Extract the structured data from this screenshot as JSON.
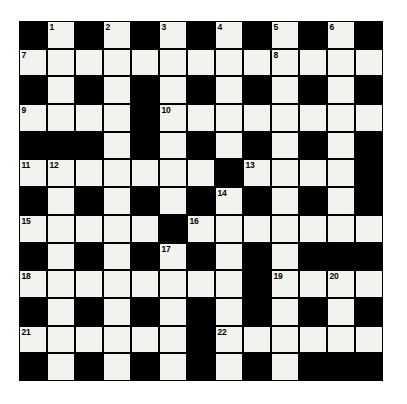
{
  "puzzle": {
    "type": "crossword-grid",
    "title": "Crossword Puzzle Grid",
    "rows": 13,
    "columns": 13,
    "colors": {
      "block": "#000000",
      "cell": "#f2f2ee",
      "border": "#000000",
      "page_background": "#ffffff",
      "number_text": "#000000"
    },
    "legend": {
      "block_symbol": "#",
      "open_symbol": "."
    },
    "grid": [
      "#.#.#.#.#.#.#",
      ".............",
      "#.#.#.#.#.#.#",
      "....#........",
      "###.#.#.#.#.#",
      ".......#....#",
      "#.#.#.#.#.#.#",
      ".....#.......",
      "#.#.#.#.#.###",
      "........#....",
      "#.#.#.#.#.#.#",
      "......#......",
      "#.#.#.#.#.###"
    ],
    "numbers": [
      {
        "n": 1,
        "row": 1,
        "col": 2
      },
      {
        "n": 2,
        "row": 1,
        "col": 4
      },
      {
        "n": 3,
        "row": 1,
        "col": 6
      },
      {
        "n": 4,
        "row": 1,
        "col": 8
      },
      {
        "n": 5,
        "row": 1,
        "col": 10
      },
      {
        "n": 6,
        "row": 1,
        "col": 12
      },
      {
        "n": 7,
        "row": 2,
        "col": 1
      },
      {
        "n": 8,
        "row": 2,
        "col": 10
      },
      {
        "n": 9,
        "row": 4,
        "col": 1
      },
      {
        "n": 10,
        "row": 4,
        "col": 6
      },
      {
        "n": 11,
        "row": 6,
        "col": 1
      },
      {
        "n": 12,
        "row": 6,
        "col": 2
      },
      {
        "n": 13,
        "row": 6,
        "col": 9
      },
      {
        "n": 14,
        "row": 7,
        "col": 8
      },
      {
        "n": 15,
        "row": 8,
        "col": 1
      },
      {
        "n": 16,
        "row": 8,
        "col": 7
      },
      {
        "n": 17,
        "row": 9,
        "col": 6
      },
      {
        "n": 18,
        "row": 10,
        "col": 1
      },
      {
        "n": 19,
        "row": 10,
        "col": 10
      },
      {
        "n": 20,
        "row": 10,
        "col": 12
      },
      {
        "n": 21,
        "row": 12,
        "col": 1
      },
      {
        "n": 22,
        "row": 12,
        "col": 8
      }
    ]
  }
}
